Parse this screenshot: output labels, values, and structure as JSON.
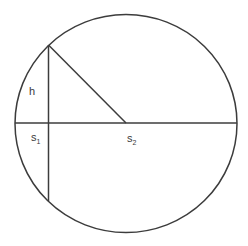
{
  "diagram": {
    "type": "geometry",
    "colors": {
      "stroke": "#3c3c3c",
      "background": "#ffffff",
      "text": "#3a3a3a"
    },
    "labels": {
      "h": {
        "base": "h",
        "sub": ""
      },
      "s1": {
        "base": "s",
        "sub": "1"
      },
      "s2": {
        "base": "s",
        "sub": "2"
      }
    }
  }
}
